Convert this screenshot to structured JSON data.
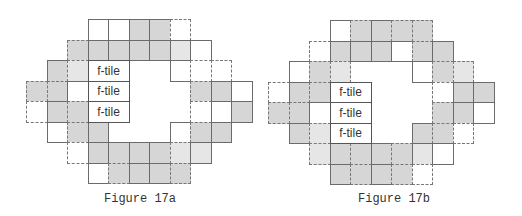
{
  "figures": [
    {
      "caption": "Figure 17a",
      "origin": [
        26,
        19
      ],
      "cell": 20.5,
      "ftile_label": "f-tile",
      "ftiles": [
        [
          3,
          2
        ],
        [
          3,
          3
        ],
        [
          3,
          4
        ]
      ],
      "rows": [
        {
          "r": 0,
          "cells": [
            [
              3,
              "white",
              "s"
            ],
            [
              4,
              "white",
              "s"
            ],
            [
              5,
              "gray",
              "s"
            ],
            [
              6,
              "gray",
              "s"
            ],
            [
              7,
              "white",
              "d"
            ]
          ]
        },
        {
          "r": 1,
          "cells": [
            [
              2,
              "gray",
              "d"
            ],
            [
              3,
              "gray",
              "s"
            ],
            [
              4,
              "gray",
              "s"
            ],
            [
              5,
              "gray",
              "s"
            ],
            [
              6,
              "gray",
              "s"
            ],
            [
              7,
              "light",
              "s"
            ],
            [
              8,
              "white",
              "s"
            ]
          ]
        },
        {
          "r": 2,
          "cells": [
            [
              1,
              "gray",
              "s"
            ],
            [
              2,
              "light",
              "d"
            ],
            [
              7,
              "white",
              "s"
            ],
            [
              8,
              "white",
              "d"
            ],
            [
              9,
              "white",
              "d"
            ]
          ]
        },
        {
          "r": 3,
          "cells": [
            [
              0,
              "gray",
              "d"
            ],
            [
              1,
              "gray",
              "d"
            ],
            [
              2,
              "white",
              "s"
            ],
            [
              8,
              "gray",
              "d"
            ],
            [
              9,
              "gray",
              "s"
            ],
            [
              10,
              "white",
              "s"
            ]
          ]
        },
        {
          "r": 4,
          "cells": [
            [
              0,
              "white",
              "d"
            ],
            [
              1,
              "gray",
              "s"
            ],
            [
              2,
              "gray",
              "d"
            ],
            [
              8,
              "white",
              "d"
            ],
            [
              9,
              "white",
              "s"
            ],
            [
              10,
              "gray",
              "s"
            ]
          ]
        },
        {
          "r": 5,
          "cells": [
            [
              1,
              "white",
              "s"
            ],
            [
              2,
              "gray",
              "d"
            ],
            [
              3,
              "gray",
              "s"
            ],
            [
              7,
              "white",
              "s"
            ],
            [
              8,
              "gray",
              "d"
            ],
            [
              9,
              "gray",
              "s"
            ]
          ]
        },
        {
          "r": 6,
          "cells": [
            [
              2,
              "white",
              "d"
            ],
            [
              3,
              "gray",
              "s"
            ],
            [
              4,
              "gray",
              "s"
            ],
            [
              5,
              "gray",
              "s"
            ],
            [
              6,
              "gray",
              "s"
            ],
            [
              7,
              "light",
              "d"
            ],
            [
              8,
              "light",
              "s"
            ]
          ]
        },
        {
          "r": 7,
          "cells": [
            [
              3,
              "white",
              "s"
            ],
            [
              4,
              "gray",
              "d"
            ],
            [
              5,
              "gray",
              "s"
            ],
            [
              6,
              "gray",
              "s"
            ],
            [
              7,
              "gray",
              "d"
            ]
          ]
        }
      ]
    },
    {
      "caption": "Figure 17b",
      "origin": [
        268,
        20
      ],
      "cell": 20.5,
      "ftile_label": "f-tile",
      "ftiles": [
        [
          3,
          3
        ],
        [
          3,
          4
        ],
        [
          3,
          5
        ]
      ],
      "rows": [
        {
          "r": 0,
          "cells": [
            [
              3,
              "white",
              "s"
            ],
            [
              4,
              "gray",
              "d"
            ],
            [
              5,
              "gray",
              "s"
            ],
            [
              6,
              "gray",
              "d"
            ],
            [
              7,
              "gray",
              "d"
            ]
          ]
        },
        {
          "r": 1,
          "cells": [
            [
              2,
              "white",
              "d"
            ],
            [
              3,
              "gray",
              "s"
            ],
            [
              4,
              "gray",
              "s"
            ],
            [
              5,
              "gray",
              "s"
            ],
            [
              6,
              "white",
              "s"
            ],
            [
              7,
              "gray",
              "d"
            ],
            [
              8,
              "gray",
              "s"
            ]
          ]
        },
        {
          "r": 2,
          "cells": [
            [
              1,
              "white",
              "s"
            ],
            [
              2,
              "gray",
              "d"
            ],
            [
              3,
              "light",
              "d"
            ],
            [
              7,
              "white",
              "s"
            ],
            [
              8,
              "gray",
              "d"
            ],
            [
              9,
              "light",
              "d"
            ]
          ]
        },
        {
          "r": 3,
          "cells": [
            [
              0,
              "white",
              "d"
            ],
            [
              1,
              "gray",
              "s"
            ],
            [
              2,
              "gray",
              "d"
            ],
            [
              8,
              "white",
              "d"
            ],
            [
              9,
              "gray",
              "s"
            ],
            [
              10,
              "gray",
              "s"
            ]
          ]
        },
        {
          "r": 4,
          "cells": [
            [
              0,
              "gray",
              "d"
            ],
            [
              1,
              "gray",
              "d"
            ],
            [
              2,
              "white",
              "s"
            ],
            [
              8,
              "gray",
              "d"
            ],
            [
              9,
              "gray",
              "s"
            ],
            [
              10,
              "white",
              "s"
            ]
          ]
        },
        {
          "r": 5,
          "cells": [
            [
              1,
              "gray",
              "s"
            ],
            [
              2,
              "light",
              "d"
            ],
            [
              7,
              "gray",
              "s"
            ],
            [
              8,
              "gray",
              "d"
            ],
            [
              9,
              "white",
              "d"
            ]
          ]
        },
        {
          "r": 6,
          "cells": [
            [
              2,
              "light",
              "d"
            ],
            [
              3,
              "gray",
              "s"
            ],
            [
              4,
              "gray",
              "d"
            ],
            [
              5,
              "gray",
              "s"
            ],
            [
              6,
              "gray",
              "d"
            ],
            [
              7,
              "light",
              "s"
            ],
            [
              8,
              "white",
              "s"
            ]
          ]
        },
        {
          "r": 7,
          "cells": [
            [
              3,
              "gray",
              "s"
            ],
            [
              4,
              "gray",
              "d"
            ],
            [
              5,
              "gray",
              "s"
            ],
            [
              6,
              "gray",
              "d"
            ],
            [
              7,
              "white",
              "d"
            ]
          ]
        }
      ]
    }
  ]
}
